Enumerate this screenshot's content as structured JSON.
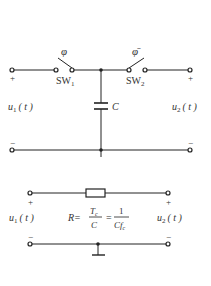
{
  "top_circuit": {
    "switch1": {
      "control": "φ",
      "label": "SW",
      "sub": "1"
    },
    "switch2": {
      "control": "φ̄",
      "label": "SW",
      "sub": "2"
    },
    "capacitor": {
      "label": "C"
    },
    "input": {
      "label": "u",
      "sub": "1",
      "arg": "( t )",
      "plus": "+",
      "minus": "−"
    },
    "output": {
      "label": "u",
      "sub": "2",
      "arg": "( t )",
      "plus": "+",
      "minus": "−"
    }
  },
  "bottom_circuit": {
    "resistor_equation": {
      "lhs": "R=",
      "frac1_num": "T",
      "frac1_num_sub": "c",
      "frac1_den": "C",
      "eq": "=",
      "frac2_num": "1",
      "frac2_den": "Cf",
      "frac2_den_sub": "c"
    },
    "input": {
      "label": "u",
      "sub": "1",
      "arg": "( t )",
      "plus": "+",
      "minus": "−"
    },
    "output": {
      "label": "u",
      "sub": "2",
      "arg": "( t )",
      "plus": "+",
      "minus": "−"
    }
  }
}
